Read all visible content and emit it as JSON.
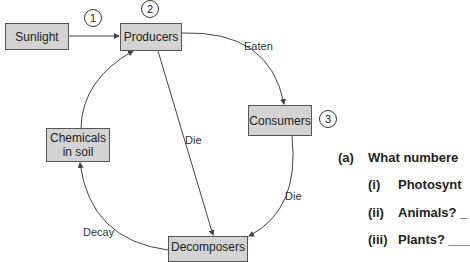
{
  "diagram": {
    "nodes": {
      "sunlight": "Sunlight",
      "producers": "Producers",
      "consumers": "Consumers",
      "chemicals_line1": "Chemicals",
      "chemicals_line2": "in soil",
      "decomposers": "Decomposers"
    },
    "markers": {
      "one": "1",
      "two": "2",
      "three": "3"
    },
    "edge_labels": {
      "eaten": "Eaten",
      "die_producers": "Die",
      "die_consumers": "Die",
      "decay": "Decay"
    },
    "edges": [
      {
        "from": "Sunlight",
        "to": "Producers",
        "label": ""
      },
      {
        "from": "Producers",
        "to": "Consumers",
        "label": "Eaten"
      },
      {
        "from": "Producers",
        "to": "Decomposers",
        "label": "Die"
      },
      {
        "from": "Consumers",
        "to": "Decomposers",
        "label": "Die"
      },
      {
        "from": "Decomposers",
        "to": "Chemicals in soil",
        "label": "Decay"
      },
      {
        "from": "Chemicals in soil",
        "to": "Producers",
        "label": ""
      }
    ],
    "colors": {
      "box_fill": "#d3d3d3",
      "box_border": "#555555",
      "line": "#444444"
    }
  },
  "questions": {
    "a": {
      "num": "(a)",
      "text": "What numbere"
    },
    "i": {
      "num": "(i)",
      "text": "Photosynt"
    },
    "ii": {
      "num": "(ii)",
      "text": "Animals? _"
    },
    "iii": {
      "num": "(iii)",
      "text": "Plants? ___"
    }
  }
}
